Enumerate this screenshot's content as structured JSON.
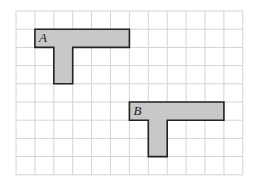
{
  "grid": {
    "origin_x": 16,
    "origin_y": 11,
    "cell_w": 18.9,
    "cell_h": 18.2,
    "cols": 12,
    "rows": 9,
    "line_color": "#d4d4d4",
    "border_color": "#cfcfcf"
  },
  "shapes": [
    {
      "label": "A",
      "fill": "#c8c8c8",
      "stroke": "#222222",
      "cells_outline": [
        [
          1,
          1
        ],
        [
          6,
          1
        ],
        [
          6,
          2
        ],
        [
          3,
          2
        ],
        [
          3,
          4
        ],
        [
          2,
          4
        ],
        [
          2,
          2
        ],
        [
          1,
          2
        ]
      ],
      "label_cell": [
        1,
        1
      ]
    },
    {
      "label": "B",
      "fill": "#c8c8c8",
      "stroke": "#222222",
      "cells_outline": [
        [
          6,
          5
        ],
        [
          11,
          5
        ],
        [
          11,
          6
        ],
        [
          8,
          6
        ],
        [
          8,
          8
        ],
        [
          7,
          8
        ],
        [
          7,
          6
        ],
        [
          6,
          6
        ]
      ],
      "label_cell": [
        6,
        5
      ]
    }
  ]
}
